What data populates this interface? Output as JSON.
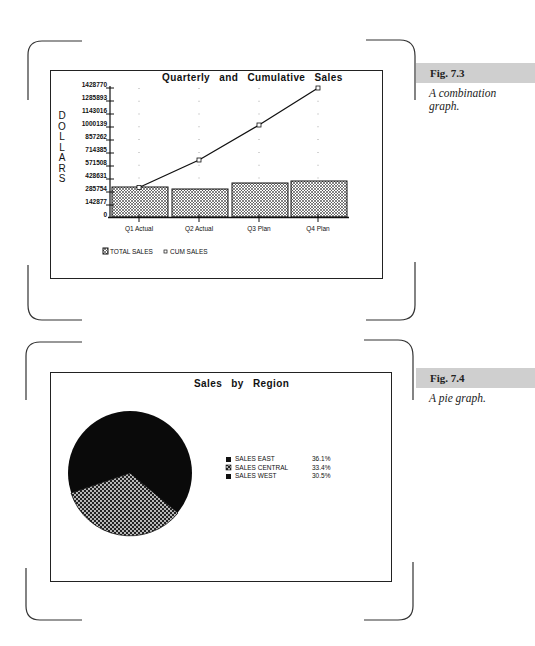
{
  "figures": [
    {
      "figure_label": "Fig. 7.3",
      "caption_line1": "A combination",
      "caption_line2": "graph.",
      "title": "Quarterly and Cumulative Sales",
      "y_axis_label": "DOLLARS",
      "y_ticks": [
        "1428770",
        "1285893",
        "1143016",
        "1000139",
        "857262",
        "714385",
        "571508",
        "428631",
        "285754",
        "142877",
        "0"
      ],
      "x_ticks": [
        "Q1 Actual",
        "Q2 Actual",
        "Q3 Plan",
        "Q4 Plan"
      ],
      "legend": [
        "TOTAL SALES",
        "CUM SALES"
      ]
    },
    {
      "figure_label": "Fig. 7.4",
      "caption_line1": "A pie graph.",
      "title": "Sales by Region",
      "legend": [
        {
          "label": "SALES EAST",
          "pct": "36.1%"
        },
        {
          "label": "SALES CENTRAL",
          "pct": "33.4%"
        },
        {
          "label": "SALES WEST",
          "pct": "30.5%"
        }
      ]
    }
  ],
  "chart_data": [
    {
      "type": "bar",
      "title": "Quarterly and Cumulative Sales",
      "xlabel": "",
      "ylabel": "DOLLARS",
      "categories": [
        "Q1 Actual",
        "Q2 Actual",
        "Q3 Plan",
        "Q4 Plan"
      ],
      "series": [
        {
          "name": "TOTAL SALES",
          "type": "bar",
          "values": [
            300000,
            280000,
            370000,
            395000
          ]
        },
        {
          "name": "CUM SALES",
          "type": "line",
          "values": [
            300000,
            580000,
            950000,
            1345000
          ]
        }
      ],
      "ylim": [
        0,
        1428770
      ],
      "yticks": [
        0,
        142877,
        285754,
        428631,
        571508,
        714385,
        857262,
        1000139,
        1143016,
        1285893,
        1428770
      ],
      "grid": "dotted vertical",
      "legend_position": "bottom-left"
    },
    {
      "type": "pie",
      "title": "Sales by Region",
      "categories": [
        "SALES EAST",
        "SALES CENTRAL",
        "SALES WEST"
      ],
      "values": [
        36.1,
        33.4,
        30.5
      ],
      "legend_position": "right"
    }
  ]
}
